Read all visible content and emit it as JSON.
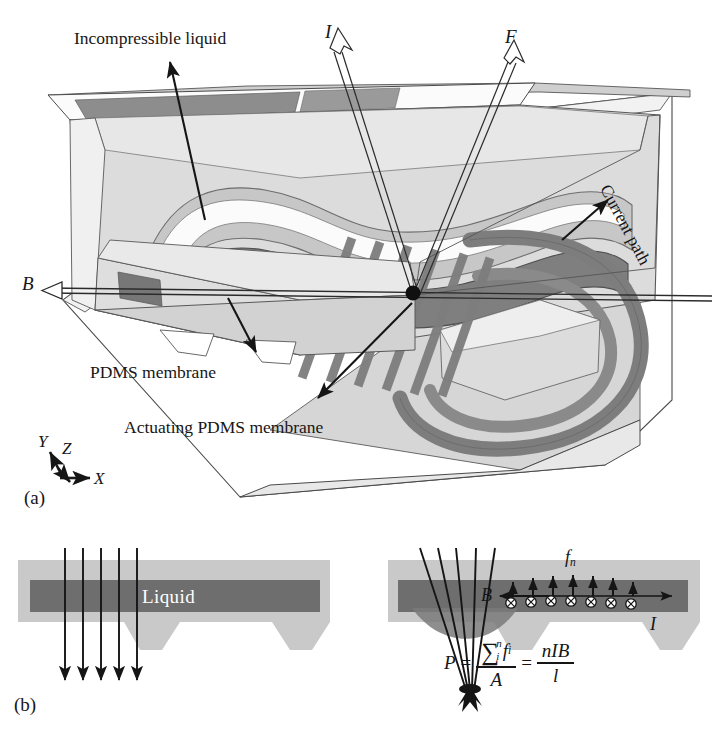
{
  "figure": {
    "domain_type": "scientific-diagram",
    "background_color": "#ffffff",
    "panels": [
      {
        "id": "a",
        "caption": "(a)"
      },
      {
        "id": "b",
        "caption": "(b)"
      }
    ]
  },
  "panel_a": {
    "caption": "(a)",
    "labels": {
      "incompressible_liquid": "Incompressible liquid",
      "current_symbol": "I",
      "force_symbol": "F",
      "magnetic_field_symbol": "B",
      "current_path": "Current path",
      "pdms_membrane": "PDMS membrane",
      "actuating_pdms_membrane": "Actuating PDMS membrane"
    },
    "axes": {
      "x": "X",
      "y": "Y",
      "z": "Z"
    }
  },
  "panel_b": {
    "caption": "(b)",
    "left": {
      "channel_label": "Liquid"
    },
    "right": {
      "force_symbol": "f",
      "force_subscript": "n",
      "magnetic_field_symbol": "B",
      "current_symbol": "I"
    },
    "formula": {
      "lhs": "P",
      "equals": "=",
      "sum_symbol": "∑",
      "sum_upper": "n",
      "sum_lower": "i",
      "sum_term": "f",
      "sum_term_subscript": "i",
      "denominator_1": "A",
      "equals_2": "=",
      "numerator_2": "nIB",
      "denominator_2": "l",
      "plain_text": "P = (∑ i..n f_i) / A = nIB / l"
    }
  },
  "colors": {
    "ink": "#151515",
    "substrate_light": "#c9c9c9",
    "substrate_mid": "#b0b0b0",
    "channel_dark": "#6e6e6e",
    "body_light": "#dcdcdc",
    "body_mid": "#aeaeae",
    "body_dark": "#8a8a8a",
    "trace_dark": "#7d7d7d",
    "white": "#ffffff"
  }
}
